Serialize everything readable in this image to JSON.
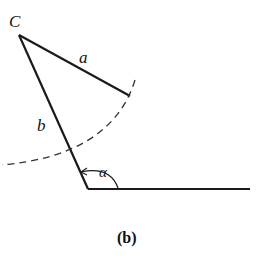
{
  "figure": {
    "caption": "(b)",
    "labels": {
      "vertex_c": "C",
      "side_a": "a",
      "side_b": "b",
      "angle": "α"
    },
    "colors": {
      "stroke": "#1a1a1a",
      "background": "#ffffff"
    }
  }
}
